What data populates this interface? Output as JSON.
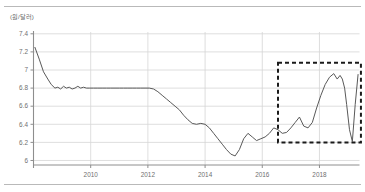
{
  "figure": {
    "unit_label": "(원/달러)",
    "rule_color": "#b9b9b9",
    "background": "#ffffff"
  },
  "chart_data": {
    "type": "line",
    "title": "",
    "subtitle": "",
    "xlabel": "",
    "ylabel": "",
    "unit_label": "(원/달러)",
    "xlim": [
      2008.0,
      2019.4
    ],
    "ylim": [
      5.95,
      7.42
    ],
    "yticks": [
      6,
      6.2,
      6.4,
      6.6,
      6.8,
      7,
      7.2,
      7.4
    ],
    "ytick_labels": [
      "6",
      "6.2",
      "6.4",
      "6.6",
      "6.8",
      "7",
      "7.2",
      "7.4"
    ],
    "xticks": [
      2010,
      2012,
      2014,
      2016,
      2018
    ],
    "xtick_labels": [
      "2010",
      "2012",
      "2014",
      "2016",
      "2018"
    ],
    "grid": true,
    "grid_color": "#d6d6d6",
    "legend": null,
    "legend_position": "none",
    "line_color": "#595959",
    "line_width": 1.0,
    "series": [
      {
        "name": "series-1",
        "x": [
          2008.05,
          2008.2,
          2008.35,
          2008.5,
          2008.62,
          2008.75,
          2008.85,
          2008.95,
          2009.05,
          2009.15,
          2009.25,
          2009.35,
          2009.45,
          2009.55,
          2009.65,
          2009.75,
          2009.85,
          2009.95,
          2010.1,
          2010.25,
          2010.4,
          2010.55,
          2010.7,
          2010.85,
          2011.0,
          2011.15,
          2011.3,
          2011.45,
          2011.6,
          2011.75,
          2011.9,
          2012.05,
          2012.2,
          2012.35,
          2012.5,
          2012.65,
          2012.8,
          2012.95,
          2013.1,
          2013.25,
          2013.4,
          2013.55,
          2013.7,
          2013.85,
          2014.0,
          2014.15,
          2014.3,
          2014.45,
          2014.6,
          2014.75,
          2014.9,
          2015.05,
          2015.2,
          2015.35,
          2015.5,
          2015.65,
          2015.8,
          2015.95,
          2016.1,
          2016.25,
          2016.4,
          2016.55,
          2016.7,
          2016.85,
          2017.0,
          2017.15,
          2017.3,
          2017.45,
          2017.6,
          2017.75,
          2017.9,
          2018.05,
          2018.2,
          2018.35,
          2018.5,
          2018.62,
          2018.72,
          2018.8,
          2018.88,
          2018.95,
          2019.05,
          2019.15,
          2019.25,
          2019.35
        ],
        "y": [
          7.25,
          7.12,
          6.98,
          6.9,
          6.84,
          6.8,
          6.81,
          6.79,
          6.82,
          6.8,
          6.81,
          6.79,
          6.8,
          6.82,
          6.8,
          6.81,
          6.8,
          6.8,
          6.8,
          6.8,
          6.8,
          6.8,
          6.8,
          6.8,
          6.8,
          6.8,
          6.8,
          6.8,
          6.8,
          6.8,
          6.8,
          6.8,
          6.79,
          6.76,
          6.72,
          6.68,
          6.64,
          6.6,
          6.56,
          6.5,
          6.45,
          6.41,
          6.4,
          6.41,
          6.4,
          6.36,
          6.3,
          6.24,
          6.18,
          6.12,
          6.07,
          6.05,
          6.12,
          6.24,
          6.3,
          6.26,
          6.22,
          6.24,
          6.26,
          6.3,
          6.36,
          6.34,
          6.3,
          6.31,
          6.36,
          6.42,
          6.48,
          6.38,
          6.36,
          6.42,
          6.58,
          6.72,
          6.84,
          6.92,
          6.96,
          6.9,
          6.94,
          6.9,
          6.8,
          6.62,
          6.34,
          6.21,
          6.62,
          6.95
        ]
      }
    ],
    "annotations": [
      {
        "type": "dashed-rect",
        "name": "highlight-box",
        "x0": 2016.55,
        "x1": 2019.45,
        "y0": 6.2,
        "y1": 7.08,
        "color": "#1a1a1a",
        "line_width": 2,
        "dash": "4 3"
      }
    ]
  }
}
